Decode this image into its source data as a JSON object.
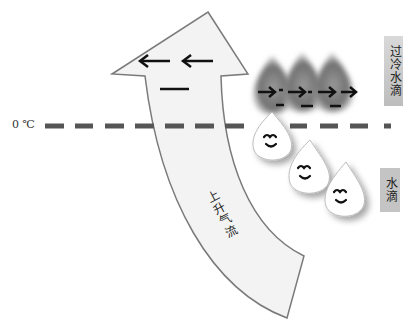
{
  "diagram": {
    "type": "cloud-physics-illustration",
    "freezing_line": {
      "label": "0 ℃",
      "color": "#555555"
    },
    "updraft_arrow": {
      "label": "上升气流",
      "fill": "#f2f2f2",
      "stroke": "#777777"
    },
    "supercooled_droplets": {
      "label": "过冷水滴",
      "count": 3,
      "color": "#7a7a7a"
    },
    "water_droplets": {
      "label": "水滴",
      "count": 3,
      "color": "#ffffff"
    },
    "arrow_head_symbols": [
      "←",
      "←",
      "—"
    ],
    "supercooled_symbols": [
      "→",
      "→",
      "→",
      "→",
      "−",
      "−",
      "−"
    ]
  }
}
